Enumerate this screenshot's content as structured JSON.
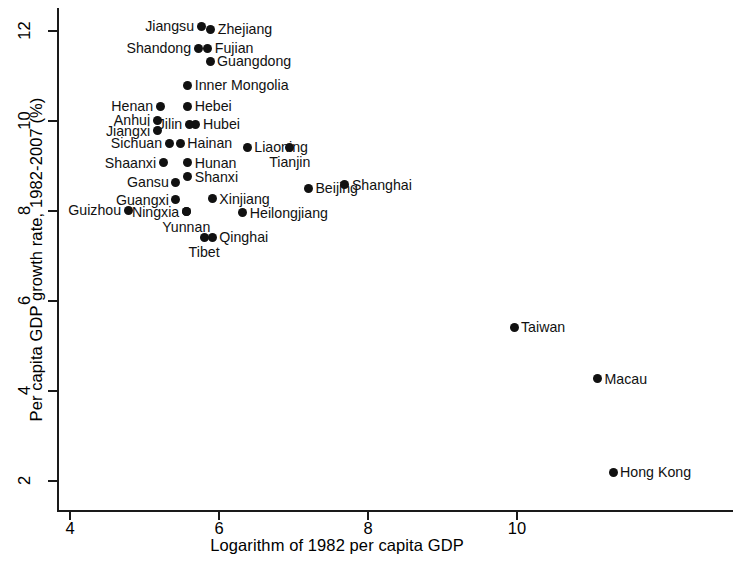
{
  "chart_data": {
    "type": "scatter",
    "title": "",
    "xlabel": "Logarithm of 1982 per capita GDP",
    "ylabel": "Per capita GDP growth rate, 1982-2007 (%)",
    "xlim": [
      3.77,
      12.9
    ],
    "ylim": [
      1.35,
      12.5
    ],
    "xticks": [
      4,
      6,
      8,
      10
    ],
    "xtick_labels": [
      "4",
      "6",
      "8",
      "10"
    ],
    "yticks": [
      2,
      4,
      6,
      8,
      10,
      12
    ],
    "ytick_labels": [
      "2",
      "4",
      "6",
      "8",
      "10",
      "12"
    ],
    "grid": false,
    "legend": null,
    "marker": "filled-circle",
    "marker_color": "#111111",
    "points": [
      {
        "label": "Jiangsu",
        "x": 5.76,
        "y": 12.11,
        "label_pos": "left"
      },
      {
        "label": "Zhejiang",
        "x": 5.89,
        "y": 12.04,
        "label_pos": "right"
      },
      {
        "label": "Shandong",
        "x": 5.72,
        "y": 11.62,
        "label_pos": "left"
      },
      {
        "label": "Fujian",
        "x": 5.85,
        "y": 11.62,
        "label_pos": "right"
      },
      {
        "label": "Guangdong",
        "x": 5.88,
        "y": 11.33,
        "label_pos": "right"
      },
      {
        "label": "Inner Mongolia",
        "x": 5.58,
        "y": 10.8,
        "label_pos": "right"
      },
      {
        "label": "Hebei",
        "x": 5.58,
        "y": 10.33,
        "label_pos": "right"
      },
      {
        "label": "Henan",
        "x": 5.21,
        "y": 10.33,
        "label_pos": "left"
      },
      {
        "label": "Anhui",
        "x": 5.17,
        "y": 10.02,
        "label_pos": "left"
      },
      {
        "label": "Hubei",
        "x": 5.69,
        "y": 9.93,
        "label_pos": "right"
      },
      {
        "label": "Jilin",
        "x": 5.6,
        "y": 9.93,
        "label_pos": "left"
      },
      {
        "label": "Jiangxi",
        "x": 5.17,
        "y": 9.78,
        "label_pos": "left"
      },
      {
        "label": "Sichuan",
        "x": 5.33,
        "y": 9.51,
        "label_pos": "left"
      },
      {
        "label": "Hainan",
        "x": 5.48,
        "y": 9.51,
        "label_pos": "right"
      },
      {
        "label": "Liaoning",
        "x": 6.38,
        "y": 9.42,
        "label_pos": "right"
      },
      {
        "label": "Shaanxi",
        "x": 5.25,
        "y": 9.07,
        "label_pos": "left"
      },
      {
        "label": "Hunan",
        "x": 5.58,
        "y": 9.07,
        "label_pos": "right"
      },
      {
        "label": "Tianjin",
        "x": 6.95,
        "y": 9.42,
        "label_pos": "below"
      },
      {
        "label": "Shanxi",
        "x": 5.58,
        "y": 8.76,
        "label_pos": "right"
      },
      {
        "label": "Gansu",
        "x": 5.42,
        "y": 8.64,
        "label_pos": "left"
      },
      {
        "label": "Beijing",
        "x": 7.2,
        "y": 8.51,
        "label_pos": "right"
      },
      {
        "label": "Shanghai",
        "x": 7.69,
        "y": 8.58,
        "label_pos": "right"
      },
      {
        "label": "Guangxi",
        "x": 5.42,
        "y": 8.25,
        "label_pos": "left"
      },
      {
        "label": "Xinjiang",
        "x": 5.91,
        "y": 8.27,
        "label_pos": "right"
      },
      {
        "label": "Guizhou",
        "x": 4.78,
        "y": 8.02,
        "label_pos": "left"
      },
      {
        "label": "Yunnan",
        "x": 5.56,
        "y": 7.98,
        "label_pos": "below"
      },
      {
        "label": "Ningxia",
        "x": 5.56,
        "y": 7.98,
        "label_pos": "left"
      },
      {
        "label": "Heilongjiang",
        "x": 6.32,
        "y": 7.96,
        "label_pos": "right"
      },
      {
        "label": "Tibet",
        "x": 5.8,
        "y": 7.42,
        "label_pos": "below"
      },
      {
        "label": "Qinghai",
        "x": 5.91,
        "y": 7.42,
        "label_pos": "right"
      },
      {
        "label": "Taiwan",
        "x": 9.96,
        "y": 5.42,
        "label_pos": "right"
      },
      {
        "label": "Macau",
        "x": 11.08,
        "y": 4.27,
        "label_pos": "right"
      },
      {
        "label": "Hong Kong",
        "x": 11.29,
        "y": 2.2,
        "label_pos": "right"
      }
    ]
  }
}
